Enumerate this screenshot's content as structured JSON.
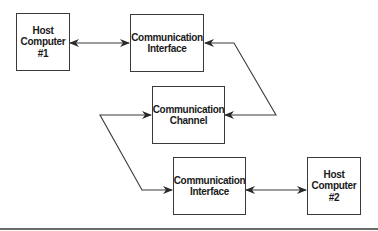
{
  "diagram": {
    "nodes": {
      "host1": {
        "lines": [
          "Host",
          "Computer",
          "#1"
        ]
      },
      "iface1": {
        "lines": [
          "Communication",
          "Interface"
        ]
      },
      "channel": {
        "lines": [
          "Communication",
          "Channel"
        ]
      },
      "iface2": {
        "lines": [
          "Communication",
          "Interface"
        ]
      },
      "host2": {
        "lines": [
          "Host",
          "Computer",
          "#2"
        ]
      }
    },
    "edges": [
      {
        "from": "host1",
        "to": "iface1",
        "type": "bidirectional"
      },
      {
        "from": "iface1",
        "to": "channel",
        "type": "bidirectional"
      },
      {
        "from": "channel",
        "to": "iface2",
        "type": "bidirectional"
      },
      {
        "from": "iface2",
        "to": "host2",
        "type": "bidirectional"
      }
    ],
    "colors": {
      "line": "#3a3a3a",
      "text": "#1a1a1a",
      "background": "#ffffff"
    }
  }
}
